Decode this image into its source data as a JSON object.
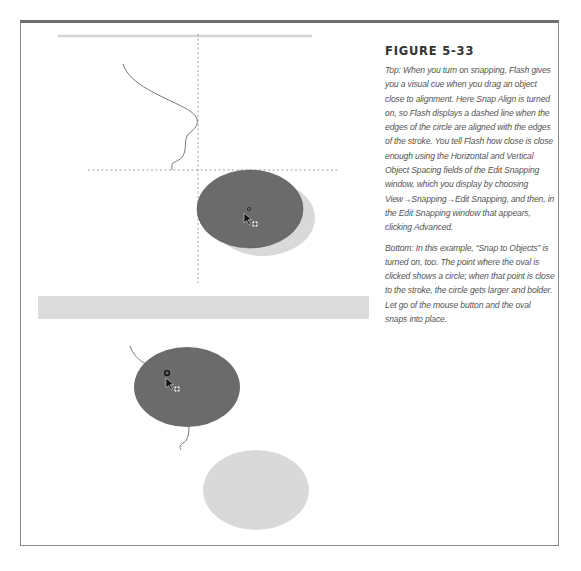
{
  "figure": {
    "title": "FIGURE 5-33",
    "paragraphs": [
      "Top: When you turn on snapping, Flash gives you a visual cue when you drag an object close to alignment. Here Snap Align is turned on, so Flash displays a dashed line when the edges of the circle are aligned with the edges of the stroke. You tell Flash how close is close enough using the Horizontal and Vertical Object Spacing fields of the Edit Snapping window, which you display by choosing View→Snapping→Edit Snapping, and then, in the Edit Snapping window that appears, clicking Advanced.",
      "Bottom: In this example, “Snap to Objects” is turned on, too. The point where the oval is clicked shows a circle; when that point is close to the stroke, the circle gets larger and bolder. Let go of the mouse button and the oval snaps into place."
    ]
  },
  "colors": {
    "frame": "#8a8a8a",
    "frame_top": "#6e6e6e",
    "dark_oval": "#6b6b6b",
    "light_oval": "#d9d9d9",
    "band": "#dcdcdc",
    "stroke": "#777777",
    "dashed": "#888888"
  }
}
